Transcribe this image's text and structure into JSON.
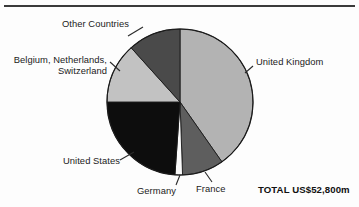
{
  "figure": {
    "total_label": "TOTAL US$52,800m",
    "has_top_rule": true,
    "background_color": "#fdfdfd"
  },
  "chart_data": {
    "type": "pie",
    "title": "",
    "subtitle": "",
    "xlabel": "",
    "ylabel": "",
    "legend_position": "none",
    "grid": false,
    "units": "US$m",
    "total": 52800,
    "total_text": "TOTAL US$52,800m",
    "start_angle_deg": 0,
    "direction": "clockwise",
    "categories": [
      "United Kingdom",
      "France",
      "Germany",
      "United States",
      "Belgium, Netherlands, Switzerland",
      "Other Countries"
    ],
    "values": [
      40.3,
      9.2,
      1.7,
      23.9,
      13.3,
      11.6
    ],
    "value_unit": "percent",
    "slices": [
      {
        "label": "United Kingdom",
        "percent": 40.3,
        "start_deg": 0,
        "end_deg": 145,
        "color": "#b3b3b3",
        "label_position": "right"
      },
      {
        "label": "France",
        "percent": 9.2,
        "start_deg": 145,
        "end_deg": 178,
        "color": "#5e5e5e",
        "label_position": "bottom-right"
      },
      {
        "label": "Germany",
        "percent": 1.7,
        "start_deg": 178,
        "end_deg": 184,
        "color": "#fafafa",
        "label_position": "bottom"
      },
      {
        "label": "United States",
        "percent": 23.9,
        "start_deg": 184,
        "end_deg": 270,
        "color": "#0d0d0d",
        "label_position": "bottom-left"
      },
      {
        "label": "Belgium, Netherlands, Switzerland",
        "percent": 13.3,
        "start_deg": 270,
        "end_deg": 318,
        "color": "#c2c2c2",
        "label_position": "left"
      },
      {
        "label": "Other Countries",
        "percent": 11.6,
        "start_deg": 318,
        "end_deg": 360,
        "color": "#4a4a4a",
        "label_position": "top-left"
      }
    ]
  },
  "labels": {
    "other_countries": "Other Countries",
    "benelux": "Belgium, Netherlands, Switzerland",
    "benelux_line1": "Belgium, Netherlands,",
    "benelux_line2": "Switzerland",
    "united_states": "United States",
    "germany": "Germany",
    "france": "France",
    "united_kingdom": "United Kingdom"
  }
}
